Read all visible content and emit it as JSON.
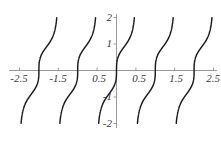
{
  "figure": {
    "kind": "function-plot",
    "background_color": "#ffffff",
    "axis_color": "#9a9a9a",
    "curve_color": "#1a1a1a",
    "label_color": "#3b3b3b"
  },
  "chart_data": {
    "type": "line",
    "title": "",
    "xlabel": "",
    "ylabel": "",
    "xlim": [
      -2.75,
      2.75
    ],
    "ylim": [
      -2.2,
      2.2
    ],
    "grid": false,
    "legend": null,
    "x_ticks": [
      -2.5,
      -1.5,
      -0.5,
      0.5,
      1.5,
      2.5
    ],
    "x_tick_labels": [
      "-2.5",
      "-1.5",
      "-0.5",
      "0.5",
      "1.5",
      "2.5"
    ],
    "y_ticks": [
      -2,
      -1,
      1,
      2
    ],
    "y_tick_labels": [
      "-2",
      "-1",
      "1",
      "2"
    ],
    "series": [
      {
        "name": "cbrt(tan(pi*x))",
        "x": [
          -2.5,
          -2.4,
          -2.3,
          -2.2,
          -2.1,
          -2.0,
          -1.9,
          -1.8,
          -1.7,
          -1.6,
          -1.5,
          -1.4,
          -1.3,
          -1.2,
          -1.1,
          -1.0,
          -0.9,
          -0.8,
          -0.7,
          -0.6,
          -0.5,
          -0.4,
          -0.3,
          -0.2,
          -0.1,
          0.0,
          0.1,
          0.2,
          0.3,
          0.4,
          0.5,
          0.6,
          0.7,
          0.8,
          0.9,
          1.0,
          1.1,
          1.2,
          1.3,
          1.4,
          1.5,
          1.6,
          1.7,
          1.8,
          1.9,
          2.0,
          2.1,
          2.2,
          2.3,
          2.4,
          2.5
        ],
        "y": [
          -2.0,
          -1.46,
          -1.11,
          -0.89,
          -0.69,
          0.0,
          0.69,
          0.89,
          1.11,
          1.46,
          2.0,
          -2.0,
          -1.46,
          -1.11,
          -0.89,
          0.0,
          0.69,
          0.89,
          1.11,
          1.46,
          -2.0,
          -1.46,
          -1.11,
          -0.89,
          -0.69,
          0.0,
          0.69,
          0.89,
          1.11,
          1.46,
          2.0,
          -2.0,
          -1.46,
          -1.11,
          -0.89,
          0.0,
          0.69,
          0.89,
          1.11,
          1.46,
          -2.0,
          -1.46,
          -1.11,
          -0.89,
          -0.69,
          0.0,
          0.69,
          0.89,
          1.11,
          1.46,
          2.0
        ]
      }
    ]
  },
  "labels": {
    "x": [
      {
        "id": "x-neg-2-5",
        "text": "-2.5"
      },
      {
        "id": "x-neg-1-5",
        "text": "-1.5"
      },
      {
        "id": "x-neg-0-5",
        "text": "0.5"
      },
      {
        "id": "x-pos-0-5",
        "text": "0.5"
      },
      {
        "id": "x-pos-1-5",
        "text": "1.5"
      },
      {
        "id": "x-pos-2-5",
        "text": "2.5"
      }
    ],
    "y": [
      {
        "id": "y-pos-2",
        "text": "2"
      },
      {
        "id": "y-pos-1",
        "text": "1"
      },
      {
        "id": "y-neg-1",
        "text": "-1"
      },
      {
        "id": "y-neg-2",
        "text": "-2"
      }
    ]
  }
}
